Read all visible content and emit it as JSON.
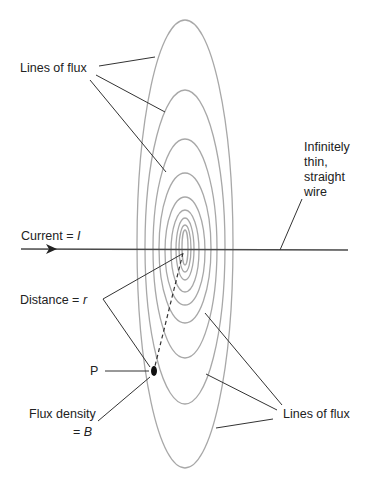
{
  "diagram": {
    "labels": {
      "lines_of_flux_top": "Lines of flux",
      "wire_line1": "Infinitely",
      "wire_line2": "thin,",
      "wire_line3": "straight",
      "wire_line4": "wire",
      "current_prefix": "Current = ",
      "current_symbol": "I",
      "distance_prefix": "Distance = ",
      "distance_symbol": "r",
      "point": "P",
      "flux_density_line1": "Flux density",
      "flux_density_prefix": "= ",
      "flux_density_symbol": "B",
      "lines_of_flux_bottom": "Lines of flux"
    },
    "colors": {
      "flux_line": "#a8a8a8",
      "wire": "#4a4a4a",
      "leader": "#333333",
      "text": "#222222"
    },
    "flux_rings": [
      {
        "cx": 185,
        "rx": 48,
        "top": 20,
        "bottom": 468
      },
      {
        "cx": 185,
        "rx": 40,
        "top": 90,
        "bottom": 404
      },
      {
        "cx": 185,
        "rx": 32,
        "top": 139,
        "bottom": 358
      },
      {
        "cx": 185,
        "rx": 26,
        "top": 173,
        "bottom": 323
      },
      {
        "cx": 185,
        "rx": 20,
        "top": 197,
        "bottom": 305
      },
      {
        "cx": 185,
        "rx": 14,
        "top": 210,
        "bottom": 292
      },
      {
        "cx": 185,
        "rx": 9,
        "top": 218,
        "bottom": 280
      },
      {
        "cx": 185,
        "rx": 6,
        "top": 225,
        "bottom": 272
      },
      {
        "cx": 185,
        "rx": 3,
        "top": 230,
        "bottom": 265
      }
    ],
    "wire": {
      "x1": 21,
      "x2": 348,
      "y": 249
    },
    "point_p": {
      "x": 154,
      "y": 371
    }
  }
}
